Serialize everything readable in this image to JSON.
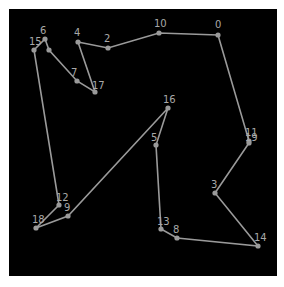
{
  "figure": {
    "type": "tsp-route",
    "panel": {
      "x": 9,
      "y": 9,
      "width": 268,
      "height": 267,
      "background": "#000000"
    },
    "colors": {
      "edge": "#9a9a9a",
      "node": "#9a9a9a",
      "label": "#a8a8a8",
      "page": "#ffffff"
    },
    "nodes": [
      {
        "id": "0",
        "label": "0",
        "x": 218,
        "y": 35,
        "lx": 215,
        "ly": 28
      },
      {
        "id": "10",
        "label": "10",
        "x": 159,
        "y": 33,
        "lx": 154,
        "ly": 27
      },
      {
        "id": "2",
        "label": "2",
        "x": 108,
        "y": 48,
        "lx": 104,
        "ly": 42
      },
      {
        "id": "4",
        "label": "4",
        "x": 78,
        "y": 42,
        "lx": 74,
        "ly": 36
      },
      {
        "id": "17",
        "label": "17",
        "x": 95,
        "y": 92,
        "lx": 92,
        "ly": 89
      },
      {
        "id": "7",
        "label": "7",
        "x": 77,
        "y": 81,
        "lx": 71,
        "ly": 76
      },
      {
        "id": "u",
        "label": "",
        "x": 49,
        "y": 50,
        "lx": 0,
        "ly": 0
      },
      {
        "id": "6",
        "label": "6",
        "x": 45,
        "y": 39,
        "lx": 40,
        "ly": 34
      },
      {
        "id": "15",
        "label": "15",
        "x": 34,
        "y": 50,
        "lx": 29,
        "ly": 45
      },
      {
        "id": "12",
        "label": "12",
        "x": 59,
        "y": 205,
        "lx": 56,
        "ly": 201
      },
      {
        "id": "18",
        "label": "18",
        "x": 36,
        "y": 228,
        "lx": 32,
        "ly": 223
      },
      {
        "id": "9",
        "label": "9",
        "x": 68,
        "y": 216,
        "lx": 64,
        "ly": 211
      },
      {
        "id": "16",
        "label": "16",
        "x": 168,
        "y": 108,
        "lx": 163,
        "ly": 103
      },
      {
        "id": "5",
        "label": "5",
        "x": 156,
        "y": 145,
        "lx": 151,
        "ly": 141
      },
      {
        "id": "13",
        "label": "13",
        "x": 161,
        "y": 229,
        "lx": 157,
        "ly": 225
      },
      {
        "id": "8",
        "label": "8",
        "x": 177,
        "y": 238,
        "lx": 173,
        "ly": 233
      },
      {
        "id": "14",
        "label": "14",
        "x": 258,
        "y": 246,
        "lx": 254,
        "ly": 241
      },
      {
        "id": "3",
        "label": "3",
        "x": 215,
        "y": 193,
        "lx": 211,
        "ly": 188
      },
      {
        "id": "11",
        "label": "11",
        "x": 249,
        "y": 141,
        "lx": 245,
        "ly": 136
      },
      {
        "id": "19",
        "label": "19",
        "x": 249,
        "y": 143,
        "lx": 245,
        "ly": 141
      }
    ],
    "route": [
      "0",
      "10",
      "2",
      "4",
      "17",
      "7",
      "u",
      "6",
      "15",
      "12",
      "18",
      "9",
      "16",
      "5",
      "13",
      "8",
      "14",
      "3",
      "19",
      "11",
      "0"
    ]
  }
}
